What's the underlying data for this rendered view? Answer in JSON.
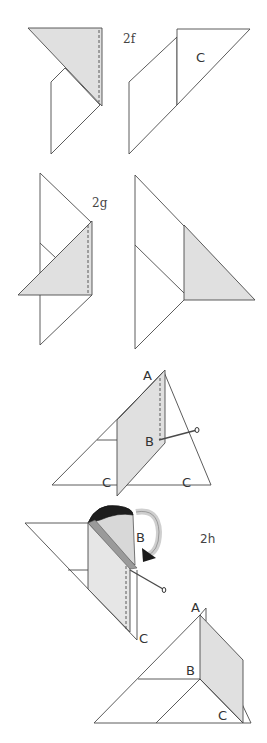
{
  "figure": {
    "type": "origami-folding-instructions",
    "colors": {
      "line": "#4a4a4a",
      "shaded_paper": "#e0e0e0",
      "paper": "#ffffff",
      "cone_dark": "#1a1a1a",
      "text": "#333333"
    },
    "steps": [
      {
        "id": "2f",
        "label": "2f",
        "point_labels": [
          "C"
        ]
      },
      {
        "id": "2g",
        "label": "2g",
        "point_labels": []
      },
      {
        "id": "pin-step",
        "label": "",
        "point_labels": [
          "A",
          "B",
          "C",
          "C"
        ]
      },
      {
        "id": "2h",
        "label": "2h",
        "point_labels": [
          "B",
          "C",
          "A",
          "B",
          "C"
        ]
      }
    ]
  },
  "labels": {
    "step_2f": "2f",
    "step_2g": "2g",
    "step_2h": "2h",
    "f2f_C": "C",
    "p3_A": "A",
    "p3_B": "B",
    "p3_C1": "C",
    "p3_C2": "C",
    "h_top_B": "B",
    "h_top_C": "C",
    "h_bot_A": "A",
    "h_bot_B": "B",
    "h_bot_C": "C"
  }
}
